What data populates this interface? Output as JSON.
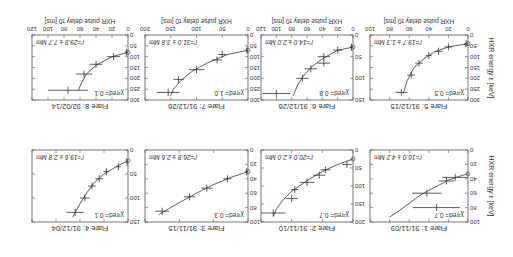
{
  "figure": {
    "orientation": "rotated-180",
    "xlabel": "HXR pulse delay τ0 [ms]",
    "ylabel": "HXR energy ε [keV]",
    "line_color": "#333333",
    "frame_color": "#555555"
  },
  "chart_data": [
    {
      "type": "scatter",
      "title": "Flare 1: 91/11/09",
      "fit_label": "l'=16.0 ± 4.2 Mm",
      "chi_label": "χ²red= 0.7",
      "xlim": [
        0,
        100
      ],
      "ylim": [
        0,
        100
      ],
      "xticks": [
        0,
        20,
        40,
        60,
        80,
        100
      ],
      "yticks": [
        0,
        20,
        40,
        60,
        80,
        100
      ],
      "points": [
        {
          "x": 13,
          "xerr": 13,
          "y": 38
        },
        {
          "x": 22,
          "xerr": 8,
          "y": 43
        },
        {
          "x": 42,
          "xerr": 15,
          "y": 60
        },
        {
          "x": 32,
          "xerr": 24,
          "y": 80
        }
      ],
      "fit": [
        [
          0,
          33
        ],
        [
          10,
          37
        ],
        [
          20,
          42
        ],
        [
          30,
          49
        ],
        [
          40,
          56
        ],
        [
          50,
          64
        ],
        [
          60,
          74
        ],
        [
          70,
          84
        ],
        [
          80,
          93
        ]
      ]
    },
    {
      "type": "scatter",
      "title": "Flare 2: 91/11/10",
      "fit_label": "l'=20.0 ± 2.0 Mm",
      "chi_label": "χ²red= 0.7",
      "xlim": [
        0,
        150
      ],
      "ylim": [
        0,
        200
      ],
      "xticks": [
        0,
        50,
        100,
        150
      ],
      "yticks": [
        0,
        50,
        100,
        150,
        200
      ],
      "points": [
        {
          "x": 10,
          "xerr": 8,
          "y": 40
        },
        {
          "x": 45,
          "xerr": 8,
          "y": 55
        },
        {
          "x": 55,
          "xerr": 10,
          "y": 70
        },
        {
          "x": 75,
          "xerr": 12,
          "y": 90
        },
        {
          "x": 95,
          "xerr": 6,
          "y": 110
        },
        {
          "x": 100,
          "xerr": 10,
          "y": 135
        },
        {
          "x": 130,
          "xerr": 20,
          "y": 175
        }
      ],
      "fit": [
        [
          0,
          25
        ],
        [
          25,
          40
        ],
        [
          50,
          60
        ],
        [
          75,
          85
        ],
        [
          100,
          115
        ],
        [
          115,
          140
        ],
        [
          125,
          165
        ],
        [
          130,
          185
        ]
      ]
    },
    {
      "type": "scatter",
      "title": "Flare 3: 91/11/15",
      "fit_label": "l'=26.8 ± 2.6 Mm",
      "chi_label": "χ²red= 0.3",
      "xlim": [
        0,
        150
      ],
      "ylim": [
        0,
        100
      ],
      "xticks": [
        0,
        50,
        100,
        150
      ],
      "yticks": [
        0,
        20,
        40,
        60,
        80,
        100
      ],
      "points": [
        {
          "x": 2,
          "xerr": 2,
          "y": 30
        },
        {
          "x": 30,
          "xerr": 6,
          "y": 40
        },
        {
          "x": 60,
          "xerr": 8,
          "y": 53
        },
        {
          "x": 85,
          "xerr": 8,
          "y": 65
        },
        {
          "x": 125,
          "xerr": 10,
          "y": 85
        }
      ],
      "fit": [
        [
          0,
          30
        ],
        [
          25,
          38
        ],
        [
          50,
          48
        ],
        [
          75,
          60
        ],
        [
          100,
          73
        ],
        [
          120,
          84
        ],
        [
          130,
          90
        ]
      ]
    },
    {
      "type": "scatter",
      "title": "Flare 4: 91/12/04",
      "fit_label": "l'=19.6 ± 2.8 Mm",
      "chi_label": "χ²red= 0.1",
      "xlim": [
        0,
        200
      ],
      "ylim": [
        0,
        150
      ],
      "xticks": [
        0,
        50,
        100,
        150,
        200
      ],
      "yticks": [
        0,
        50,
        100,
        150
      ],
      "points": [
        {
          "x": 2,
          "xerr": 2,
          "y": 25
        },
        {
          "x": 20,
          "xerr": 5,
          "y": 35
        },
        {
          "x": 45,
          "xerr": 6,
          "y": 45
        },
        {
          "x": 60,
          "xerr": 8,
          "y": 60
        },
        {
          "x": 75,
          "xerr": 8,
          "y": 75
        },
        {
          "x": 90,
          "xerr": 10,
          "y": 100
        },
        {
          "x": 110,
          "xerr": 18,
          "y": 130
        }
      ],
      "fit": [
        [
          0,
          22
        ],
        [
          25,
          35
        ],
        [
          50,
          50
        ],
        [
          70,
          68
        ],
        [
          85,
          88
        ],
        [
          100,
          112
        ],
        [
          110,
          130
        ],
        [
          115,
          140
        ]
      ]
    },
    {
      "type": "scatter",
      "title": "Flare 5: 91/12/15",
      "fit_label": "l'=19.7 ± 1.3 Mm",
      "chi_label": "χ²red= 0.5",
      "xlim": [
        0,
        100
      ],
      "ylim": [
        0,
        300
      ],
      "xticks": [
        0,
        20,
        40,
        60,
        80,
        100
      ],
      "yticks": [
        0,
        50,
        100,
        150,
        200,
        250,
        300
      ],
      "points": [
        {
          "x": 2,
          "xerr": 2,
          "y": 40
        },
        {
          "x": 20,
          "xerr": 4,
          "y": 55
        },
        {
          "x": 30,
          "xerr": 4,
          "y": 75
        },
        {
          "x": 40,
          "xerr": 3,
          "y": 95
        },
        {
          "x": 50,
          "xerr": 4,
          "y": 130
        },
        {
          "x": 58,
          "xerr": 4,
          "y": 185
        },
        {
          "x": 68,
          "xerr": 6,
          "y": 265
        }
      ],
      "fit": [
        [
          0,
          40
        ],
        [
          20,
          55
        ],
        [
          35,
          80
        ],
        [
          45,
          110
        ],
        [
          55,
          150
        ],
        [
          62,
          210
        ],
        [
          66,
          270
        ]
      ]
    },
    {
      "type": "scatter",
      "title": "Flare 6: 91/12/26",
      "fit_label": "l'=14.0 ± 2.0 Mm",
      "chi_label": "χ²red= 0.8",
      "xlim": [
        0,
        120
      ],
      "ylim": [
        0,
        150
      ],
      "xticks": [
        0,
        20,
        40,
        60,
        80,
        100,
        120
      ],
      "yticks": [
        0,
        50,
        100,
        150
      ],
      "points": [
        {
          "x": 2,
          "xerr": 2,
          "y": 28
        },
        {
          "x": 20,
          "xerr": 6,
          "y": 35
        },
        {
          "x": 38,
          "xerr": 8,
          "y": 50
        },
        {
          "x": 38,
          "xerr": 8,
          "y": 65
        },
        {
          "x": 55,
          "xerr": 8,
          "y": 78
        },
        {
          "x": 66,
          "xerr": 8,
          "y": 100
        },
        {
          "x": 100,
          "xerr": 18,
          "y": 135
        }
      ],
      "fit": [
        [
          0,
          28
        ],
        [
          20,
          35
        ],
        [
          40,
          55
        ],
        [
          55,
          75
        ],
        [
          65,
          95
        ],
        [
          72,
          115
        ],
        [
          78,
          140
        ]
      ]
    },
    {
      "type": "scatter",
      "title": "Flare 7: 91/12/26",
      "fit_label": "l'=31.0 ± 3.8 Mm",
      "chi_label": "χ²red= 1.0",
      "xlim": [
        0,
        200
      ],
      "ylim": [
        0,
        300
      ],
      "xticks": [
        0,
        50,
        100,
        150,
        200
      ],
      "yticks": [
        0,
        50,
        100,
        150,
        200,
        250,
        300
      ],
      "points": [
        {
          "x": 2,
          "xerr": 2,
          "y": 70
        },
        {
          "x": 50,
          "xerr": 8,
          "y": 90
        },
        {
          "x": 60,
          "xerr": 10,
          "y": 115
        },
        {
          "x": 100,
          "xerr": 15,
          "y": 160
        },
        {
          "x": 135,
          "xerr": 10,
          "y": 205
        },
        {
          "x": 155,
          "xerr": 22,
          "y": 265
        }
      ],
      "fit": [
        [
          0,
          70
        ],
        [
          40,
          90
        ],
        [
          80,
          130
        ],
        [
          110,
          170
        ],
        [
          130,
          210
        ],
        [
          145,
          250
        ],
        [
          150,
          280
        ]
      ]
    },
    {
      "type": "scatter",
      "title": "Flare 8: 92/02/14",
      "fit_label": "l'=29.8 ± 7.7 Mm",
      "chi_label": "χ²red= 0.1",
      "xlim": [
        0,
        120
      ],
      "ylim": [
        0,
        300
      ],
      "xticks": [
        0,
        20,
        40,
        60,
        80,
        100,
        120
      ],
      "yticks": [
        0,
        50,
        100,
        150,
        200,
        250,
        300
      ],
      "points": [
        {
          "x": 2,
          "xerr": 2,
          "y": 80
        },
        {
          "x": 18,
          "xerr": 8,
          "y": 100
        },
        {
          "x": 40,
          "xerr": 8,
          "y": 135
        },
        {
          "x": 55,
          "xerr": 10,
          "y": 180
        },
        {
          "x": 75,
          "xerr": 25,
          "y": 255
        }
      ],
      "fit": [
        [
          0,
          80
        ],
        [
          20,
          100
        ],
        [
          40,
          140
        ],
        [
          52,
          180
        ],
        [
          58,
          220
        ],
        [
          62,
          255
        ]
      ]
    }
  ]
}
